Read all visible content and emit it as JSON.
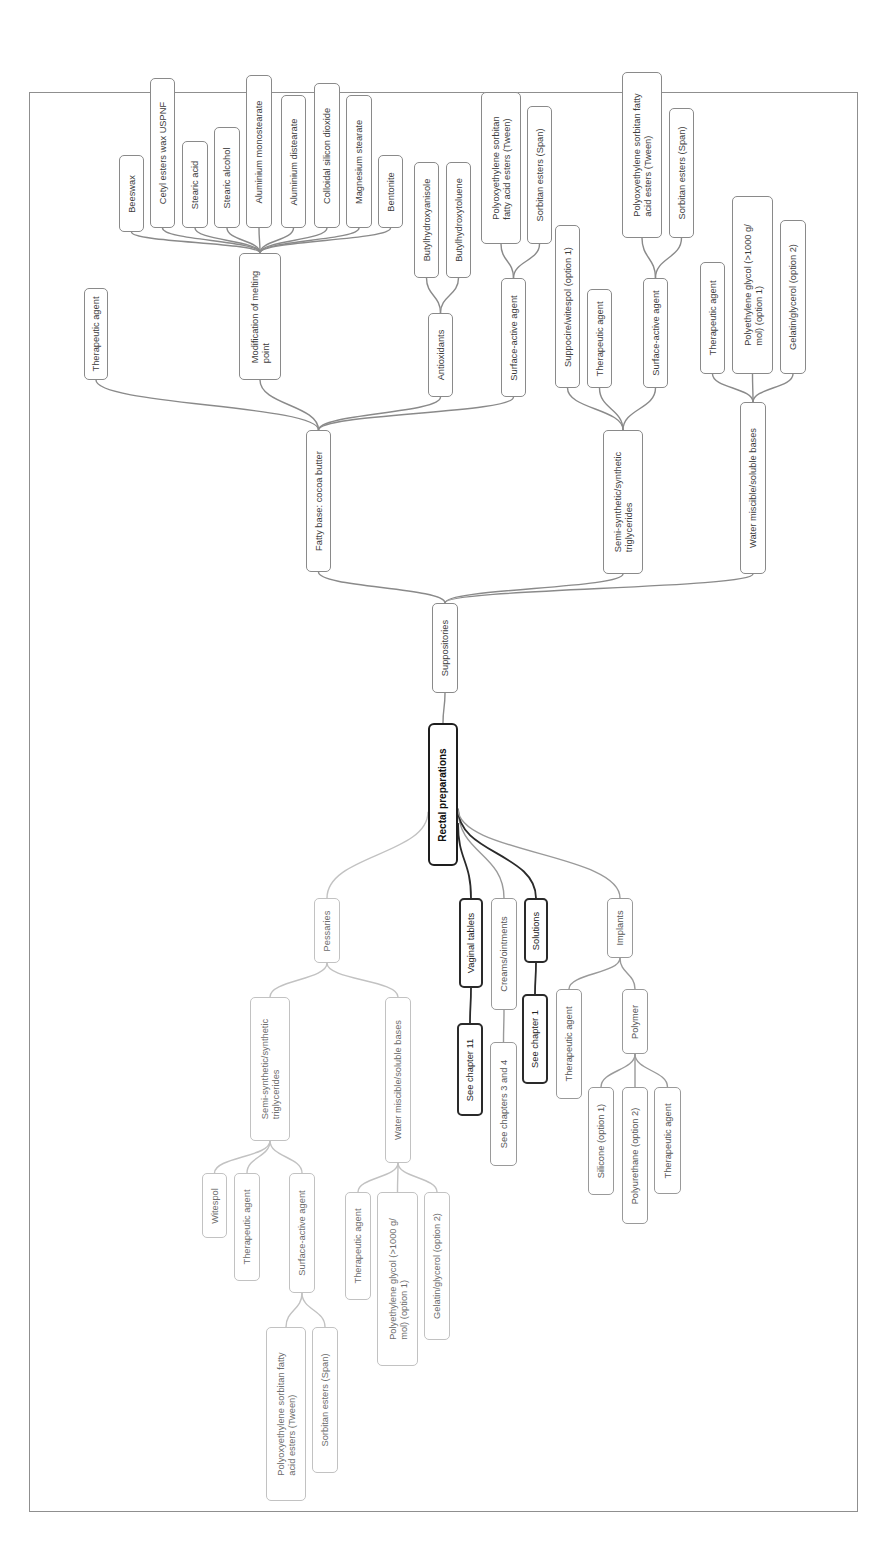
{
  "diagram": {
    "type": "mind-map",
    "orientation": "rotated-90-ccw",
    "colors": {
      "frame": "#8f8f8f",
      "suppositories_branch": "#8a8a8a",
      "pessaries_branch": "#c2c2c2",
      "vaginal_solutions_branch": "#2a2a2a",
      "creams_implants_branch": "#9a9a9a",
      "root_border": "#1e1e1e"
    },
    "root": {
      "id": "root",
      "label": "Rectal preparations"
    },
    "nodes": [
      {
        "id": "supp",
        "label": "Suppositories",
        "parent": "root",
        "style": "mid",
        "box": [
          432,
          603,
          26,
          90
        ]
      },
      {
        "id": "fatty",
        "label": "Fatty base: cocoa butter",
        "parent": "supp",
        "style": "mid",
        "box": [
          306,
          430,
          25,
          142
        ]
      },
      {
        "id": "semi",
        "label": "Semi-synthetic/synthetic\ntriglycerides",
        "parent": "supp",
        "style": "mid",
        "box": [
          603,
          430,
          40,
          144
        ]
      },
      {
        "id": "water",
        "label": "Water miscible/soluble bases",
        "parent": "supp",
        "style": "mid",
        "box": [
          740,
          402,
          26,
          172
        ]
      },
      {
        "id": "f_ther",
        "label": "Therapeutic agent",
        "parent": "fatty",
        "style": "mid",
        "box": [
          84,
          288,
          24,
          92
        ]
      },
      {
        "id": "f_mod",
        "label": "Modification of melting\npoint",
        "parent": "fatty",
        "style": "mid",
        "box": [
          239,
          253,
          42,
          127
        ]
      },
      {
        "id": "f_anti",
        "label": "Antioxidants",
        "parent": "fatty",
        "style": "mid",
        "box": [
          428,
          313,
          25,
          84
        ]
      },
      {
        "id": "f_surf",
        "label": "Surface-active agent",
        "parent": "fatty",
        "style": "mid",
        "box": [
          501,
          278,
          25,
          119
        ]
      },
      {
        "id": "m1",
        "label": "Beeswax",
        "parent": "f_mod",
        "style": "mid",
        "box": [
          119,
          155,
          25,
          77
        ]
      },
      {
        "id": "m2",
        "label": "Cetyl esters wax USPNF",
        "parent": "f_mod",
        "style": "mid",
        "box": [
          150,
          78,
          25,
          150
        ]
      },
      {
        "id": "m3",
        "label": "Stearic acid",
        "parent": "f_mod",
        "style": "mid",
        "box": [
          182,
          141,
          26,
          87
        ]
      },
      {
        "id": "m4",
        "label": "Stearic alcohol",
        "parent": "f_mod",
        "style": "mid",
        "box": [
          214,
          127,
          26,
          101
        ]
      },
      {
        "id": "m5",
        "label": "Aluminium monostearate",
        "parent": "f_mod",
        "style": "mid",
        "box": [
          246,
          75,
          26,
          153
        ]
      },
      {
        "id": "m6",
        "label": "Aluminium distearate",
        "parent": "f_mod",
        "style": "mid",
        "box": [
          281,
          95,
          25,
          133
        ]
      },
      {
        "id": "m7",
        "label": "Colloidal silicon dioxide",
        "parent": "f_mod",
        "style": "mid",
        "box": [
          314,
          83,
          26,
          145
        ]
      },
      {
        "id": "m8",
        "label": "Magnesium stearate",
        "parent": "f_mod",
        "style": "mid",
        "box": [
          346,
          95,
          26,
          133
        ]
      },
      {
        "id": "m9",
        "label": "Bentonite",
        "parent": "f_mod",
        "style": "mid",
        "box": [
          378,
          155,
          25,
          73
        ]
      },
      {
        "id": "a1",
        "label": "Butylhydroxyanisole",
        "parent": "f_anti",
        "style": "mid",
        "box": [
          414,
          162,
          25,
          116
        ]
      },
      {
        "id": "a2",
        "label": "Butylhydroxytoluene",
        "parent": "f_anti",
        "style": "mid",
        "box": [
          446,
          162,
          25,
          116
        ]
      },
      {
        "id": "fs1",
        "label": "Polyoxyethylene sorbitan\nfatty acid esters (Tween)",
        "parent": "f_surf",
        "style": "mid",
        "box": [
          481,
          92,
          40,
          152
        ]
      },
      {
        "id": "fs2",
        "label": "Sorbitan esters (Span)",
        "parent": "f_surf",
        "style": "mid",
        "box": [
          527,
          106,
          25,
          138
        ]
      },
      {
        "id": "s_supp",
        "label": "Suppocire/witespol (option 1)",
        "parent": "semi",
        "style": "mid",
        "box": [
          555,
          225,
          25,
          163
        ]
      },
      {
        "id": "s_ther",
        "label": "Therapeutic agent",
        "parent": "semi",
        "style": "mid",
        "box": [
          587,
          289,
          25,
          99
        ]
      },
      {
        "id": "s_surf",
        "label": "Surface-active agent",
        "parent": "semi",
        "style": "mid",
        "box": [
          643,
          278,
          25,
          110
        ]
      },
      {
        "id": "ss1",
        "label": "Polyoxyethylene sorbitan fatty\nacid esters (Tween)",
        "parent": "s_surf",
        "style": "mid",
        "box": [
          622,
          72,
          40,
          166
        ]
      },
      {
        "id": "ss2",
        "label": "Sorbitan esters (Span)",
        "parent": "s_surf",
        "style": "mid",
        "box": [
          669,
          108,
          25,
          130
        ]
      },
      {
        "id": "w_ther",
        "label": "Therapeutic agent",
        "parent": "water",
        "style": "mid",
        "box": [
          700,
          262,
          25,
          112
        ]
      },
      {
        "id": "w_peg",
        "label": "Polyethylene glycol (>1000 g/\nmol) (option 1)",
        "parent": "water",
        "style": "mid",
        "box": [
          732,
          196,
          41,
          178
        ]
      },
      {
        "id": "w_gel",
        "label": "Gelatin/glycerol (option 2)",
        "parent": "water",
        "style": "mid",
        "box": [
          780,
          220,
          26,
          154
        ]
      },
      {
        "id": "pess",
        "label": "Pessaries",
        "parent": "root",
        "style": "light",
        "box": [
          314,
          898,
          26,
          65
        ]
      },
      {
        "id": "p_semi",
        "label": "Semi-synthetic/synthetic\ntriglycerides",
        "parent": "pess",
        "style": "light",
        "box": [
          250,
          997,
          40,
          144
        ]
      },
      {
        "id": "p_water",
        "label": "Water miscible/soluble bases",
        "parent": "pess",
        "style": "light",
        "box": [
          385,
          997,
          26,
          166
        ]
      },
      {
        "id": "p_wit",
        "label": "Witespol",
        "parent": "p_semi",
        "style": "light",
        "box": [
          202,
          1173,
          25,
          65
        ]
      },
      {
        "id": "p_ther",
        "label": "Therapeutic agent",
        "parent": "p_semi",
        "style": "light",
        "box": [
          234,
          1173,
          26,
          108
        ]
      },
      {
        "id": "p_surf",
        "label": "Surface-active agent",
        "parent": "p_semi",
        "style": "light",
        "box": [
          289,
          1173,
          26,
          120
        ]
      },
      {
        "id": "ps1",
        "label": "Polyoxyethylene sorbitan fatty\nacid esters (Tween)",
        "parent": "p_surf",
        "style": "light",
        "box": [
          266,
          1327,
          40,
          174
        ]
      },
      {
        "id": "ps2",
        "label": "Sorbitan esters (Span)",
        "parent": "p_surf",
        "style": "light",
        "box": [
          312,
          1327,
          26,
          146
        ]
      },
      {
        "id": "pw_ther",
        "label": "Therapeutic agent",
        "parent": "p_water",
        "style": "light",
        "box": [
          345,
          1192,
          26,
          108
        ]
      },
      {
        "id": "pw_peg",
        "label": "Polyethylene glycol (>1000 g/\nmol) (option 1)",
        "parent": "p_water",
        "style": "light",
        "box": [
          377,
          1192,
          41,
          174
        ]
      },
      {
        "id": "pw_gel",
        "label": "Gelatin/glycerol (option 2)",
        "parent": "p_water",
        "style": "light",
        "box": [
          424,
          1192,
          26,
          148
        ]
      },
      {
        "id": "vag",
        "label": "Vaginal tablets",
        "parent": "root",
        "style": "dark",
        "box": [
          459,
          898,
          24,
          90
        ]
      },
      {
        "id": "vag_see",
        "label": "See chapter 11",
        "parent": "vag",
        "style": "dark",
        "box": [
          457,
          1023,
          26,
          93
        ]
      },
      {
        "id": "cream",
        "label": "Creams/ointments",
        "parent": "root",
        "style": "mid2",
        "box": [
          491,
          898,
          26,
          112
        ]
      },
      {
        "id": "cream_see",
        "label": "See chapters 3 and 4",
        "parent": "cream",
        "style": "mid2",
        "box": [
          490,
          1042,
          27,
          124
        ]
      },
      {
        "id": "sol",
        "label": "Solutions",
        "parent": "root",
        "style": "dark",
        "box": [
          524,
          898,
          24,
          65
        ]
      },
      {
        "id": "sol_see",
        "label": "See chapter 1",
        "parent": "sol",
        "style": "dark",
        "box": [
          522,
          994,
          26,
          90
        ]
      },
      {
        "id": "impl",
        "label": "Implants",
        "parent": "root",
        "style": "mid2",
        "box": [
          607,
          898,
          26,
          60
        ]
      },
      {
        "id": "i_ther",
        "label": "Therapeutic agent",
        "parent": "impl",
        "style": "mid2",
        "box": [
          556,
          989,
          26,
          110
        ]
      },
      {
        "id": "i_poly",
        "label": "Polymer",
        "parent": "impl",
        "style": "mid2",
        "box": [
          622,
          989,
          26,
          65
        ]
      },
      {
        "id": "ip1",
        "label": "Silicone (option 1)",
        "parent": "i_poly",
        "style": "mid2",
        "box": [
          588,
          1087,
          26,
          108
        ]
      },
      {
        "id": "ip2",
        "label": "Polyurethane (option 2)",
        "parent": "i_poly",
        "style": "mid2",
        "box": [
          622,
          1087,
          26,
          137
        ]
      },
      {
        "id": "ip3",
        "label": "Therapeutic agent",
        "parent": "i_poly",
        "style": "mid2",
        "box": [
          654,
          1087,
          27,
          107
        ]
      }
    ]
  }
}
